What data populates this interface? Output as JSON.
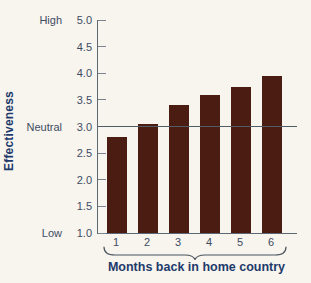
{
  "colors": {
    "background": "#f8f4ee",
    "bar": "#4b1c12",
    "axis": "#5d6874",
    "reference_line": "#525c66",
    "tick_label": "#3d4c63",
    "axis_title": "#1d3a6b"
  },
  "chart_data": {
    "type": "bar",
    "title": "",
    "xlabel": "Months back in home country",
    "ylabel": "Effectiveness",
    "categories": [
      "1",
      "2",
      "3",
      "4",
      "5",
      "6"
    ],
    "values": [
      2.8,
      3.05,
      3.4,
      3.6,
      3.75,
      3.95
    ],
    "ylim": [
      1.0,
      5.0
    ],
    "yticks": [
      1.0,
      1.5,
      2.0,
      2.5,
      3.0,
      3.5,
      4.0,
      4.5,
      5.0
    ],
    "ytick_labels": [
      "1.0",
      "1.5",
      "2.0",
      "2.5",
      "3.0",
      "3.5",
      "4.0",
      "4.5",
      "5.0"
    ],
    "y_annotations": [
      {
        "value": 5.0,
        "label": "High"
      },
      {
        "value": 3.0,
        "label": "Neutral"
      },
      {
        "value": 1.0,
        "label": "Low"
      }
    ],
    "reference_line_value": 3.0,
    "grid": false,
    "legend": "none"
  }
}
